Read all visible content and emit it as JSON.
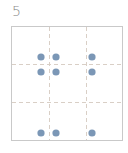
{
  "panel": {
    "label": "5"
  },
  "grid": {
    "box": {
      "x": 11,
      "y": 26,
      "width": 111,
      "height": 114
    },
    "border_color": "#c9c9c9",
    "divider_color": "#d9cfc6",
    "vertical_dividers_x": [
      49,
      86
    ],
    "horizontal_dividers_y": [
      64,
      102
    ],
    "rows": 3,
    "cols": 3
  },
  "dots": {
    "color": "#7b97b6",
    "radius": 3.6,
    "points": [
      {
        "x": 41,
        "y": 57
      },
      {
        "x": 56,
        "y": 57
      },
      {
        "x": 92,
        "y": 57
      },
      {
        "x": 41,
        "y": 72
      },
      {
        "x": 56,
        "y": 72
      },
      {
        "x": 92,
        "y": 72
      },
      {
        "x": 41,
        "y": 133
      },
      {
        "x": 56,
        "y": 133
      },
      {
        "x": 92,
        "y": 133
      }
    ]
  }
}
